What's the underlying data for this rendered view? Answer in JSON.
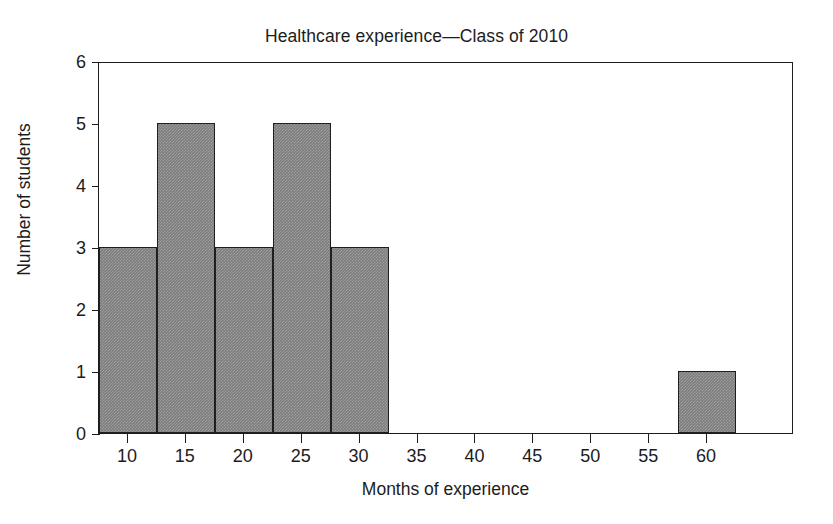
{
  "chart_data": {
    "type": "bar",
    "title": "Healthcare experience—Class of 2010",
    "xlabel": "Months of experience",
    "ylabel": "Number of students",
    "xlim": [
      7.5,
      67.5
    ],
    "ylim": [
      0,
      6
    ],
    "grid": false,
    "legend": null,
    "bin_width": 5,
    "bin_edges": [
      7.5,
      12.5,
      17.5,
      22.5,
      27.5,
      32.5,
      37.5,
      42.5,
      47.5,
      52.5,
      57.5,
      62.5
    ],
    "bin_centers": [
      10,
      15,
      20,
      25,
      30,
      35,
      40,
      45,
      50,
      55,
      60
    ],
    "values": [
      3,
      5,
      3,
      5,
      3,
      0,
      0,
      0,
      0,
      0,
      1
    ],
    "categories": [
      "10",
      "15",
      "20",
      "25",
      "30",
      "35",
      "40",
      "45",
      "50",
      "55",
      "60"
    ],
    "bars": [
      {
        "label": "7.5–12.5",
        "start": 7.5,
        "end": 12.5,
        "value": 3
      },
      {
        "label": "12.5–17.5",
        "start": 12.5,
        "end": 17.5,
        "value": 5
      },
      {
        "label": "17.5–22.5",
        "start": 17.5,
        "end": 22.5,
        "value": 3
      },
      {
        "label": "22.5–27.5",
        "start": 22.5,
        "end": 27.5,
        "value": 5
      },
      {
        "label": "27.5–32.5",
        "start": 27.5,
        "end": 32.5,
        "value": 3
      },
      {
        "label": "57.5–62.5",
        "start": 57.5,
        "end": 62.5,
        "value": 1
      }
    ],
    "xticks": [
      10,
      15,
      20,
      25,
      30,
      35,
      40,
      45,
      50,
      55,
      60
    ],
    "xtick_labels": [
      "10",
      "15",
      "20",
      "25",
      "30",
      "35",
      "40",
      "45",
      "50",
      "55",
      "60"
    ],
    "yticks": [
      0,
      1,
      2,
      3,
      4,
      5,
      6
    ],
    "ytick_labels": [
      "0",
      "1",
      "2",
      "3",
      "4",
      "5",
      "6"
    ],
    "colors": {
      "bar_fill": "#7d7d7d",
      "bar_edge": "#1f1f1f",
      "axis": "#1c1c1c",
      "background": "#ffffff",
      "text": "#1c1c1c"
    }
  }
}
